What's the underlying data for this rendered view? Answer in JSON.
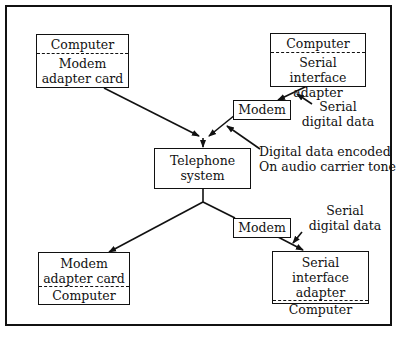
{
  "diagram": {
    "top_left": {
      "top": "Computer",
      "bottom_line1": "Modem",
      "bottom_line2": "adapter card"
    },
    "top_right": {
      "top": "Computer",
      "bottom_line1": "Serial",
      "bottom_line2": "interface adapter"
    },
    "modem_top": "Modem",
    "modem_bottom": "Modem",
    "telephone": {
      "line1": "Telephone",
      "line2": "system"
    },
    "bottom_left": {
      "top_line1": "Modem",
      "top_line2": "adapter card",
      "bottom": "Computer"
    },
    "bottom_right": {
      "top_line1": "Serial",
      "top_line2": "interface adapter",
      "bottom": "Computer"
    },
    "annotations": {
      "serial_top_line1": "Serial",
      "serial_top_line2": "digital data",
      "encoded_line1": "Digital data encoded",
      "encoded_line2": "On audio carrier tone",
      "serial_bottom_line1": "Serial",
      "serial_bottom_line2": "digital data"
    }
  }
}
